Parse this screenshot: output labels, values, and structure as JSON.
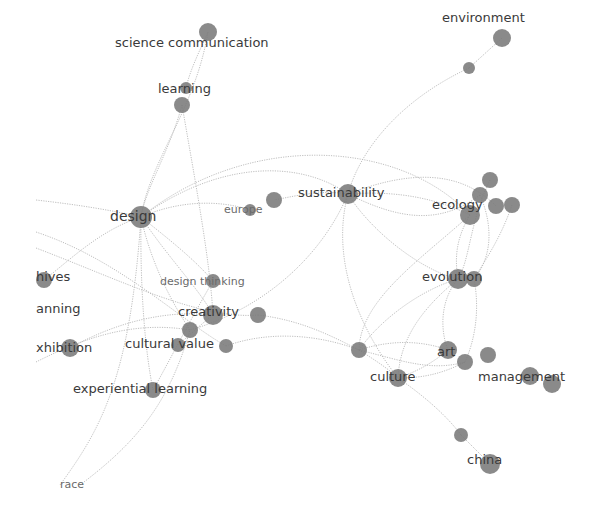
{
  "diagram": {
    "type": "keyword-co-occurrence-network",
    "node_color": "#7a7a7a",
    "edge_color": "#b8b8b8",
    "label_color": "#3a3a3a",
    "nodes": [
      {
        "id": "science_communication",
        "label": "science communication",
        "x": 208,
        "y": 32,
        "r": 9,
        "lx": 115,
        "ly": 47,
        "size": "normal"
      },
      {
        "id": "learning",
        "label": "learning",
        "x": 182,
        "y": 105,
        "r": 8,
        "lx": 158,
        "ly": 93,
        "size": "normal"
      },
      {
        "id": "learning_b",
        "label": "",
        "x": 186,
        "y": 88,
        "r": 6
      },
      {
        "id": "environment",
        "label": "environment",
        "x": 502,
        "y": 38,
        "r": 9,
        "lx": 442,
        "ly": 22,
        "size": "normal"
      },
      {
        "id": "environment_b",
        "label": "",
        "x": 469,
        "y": 68,
        "r": 6
      },
      {
        "id": "design",
        "label": "design",
        "x": 141,
        "y": 217,
        "r": 11,
        "lx": 110,
        "ly": 221,
        "size": "big"
      },
      {
        "id": "europe",
        "label": "europe",
        "x": 274,
        "y": 200,
        "r": 8,
        "lx": 224,
        "ly": 213,
        "size": "small"
      },
      {
        "id": "europe_b",
        "label": "",
        "x": 250,
        "y": 210,
        "r": 6
      },
      {
        "id": "sustainability",
        "label": "sustainability",
        "x": 348,
        "y": 194,
        "r": 10,
        "lx": 298,
        "ly": 197,
        "size": "normal"
      },
      {
        "id": "ecology",
        "label": "ecology",
        "x": 470,
        "y": 215,
        "r": 10,
        "lx": 432,
        "ly": 209,
        "size": "normal"
      },
      {
        "id": "ecology_b",
        "label": "",
        "x": 490,
        "y": 180,
        "r": 8
      },
      {
        "id": "ecology_c",
        "label": "",
        "x": 480,
        "y": 195,
        "r": 8
      },
      {
        "id": "ecology_d",
        "label": "",
        "x": 496,
        "y": 206,
        "r": 8
      },
      {
        "id": "ecology_e",
        "label": "",
        "x": 512,
        "y": 205,
        "r": 8
      },
      {
        "id": "evolution",
        "label": "evolution",
        "x": 458,
        "y": 279,
        "r": 10,
        "lx": 422,
        "ly": 281,
        "size": "normal"
      },
      {
        "id": "evolution_b",
        "label": "",
        "x": 474,
        "y": 279,
        "r": 8
      },
      {
        "id": "archives",
        "label": "hives",
        "x": 44,
        "y": 280,
        "r": 8,
        "lx": 36,
        "ly": 281,
        "size": "normal"
      },
      {
        "id": "planning",
        "label": "anning",
        "x": 0,
        "y": 0,
        "r": 0,
        "lx": 36,
        "ly": 313,
        "size": "normal"
      },
      {
        "id": "exhibition",
        "label": "xhibition",
        "x": 70,
        "y": 348,
        "r": 9,
        "lx": 36,
        "ly": 352,
        "size": "normal"
      },
      {
        "id": "design_thinking",
        "label": "design thinking",
        "x": 213,
        "y": 281,
        "r": 7,
        "lx": 160,
        "ly": 285,
        "size": "small"
      },
      {
        "id": "creativity",
        "label": "creativity",
        "x": 213,
        "y": 315,
        "r": 10,
        "lx": 178,
        "ly": 316,
        "size": "normal"
      },
      {
        "id": "creativity_b",
        "label": "",
        "x": 258,
        "y": 315,
        "r": 8
      },
      {
        "id": "cultural_value",
        "label": "cultural value",
        "x": 190,
        "y": 330,
        "r": 8,
        "lx": 125,
        "ly": 348,
        "size": "normal"
      },
      {
        "id": "cultural_value_b",
        "label": "",
        "x": 226,
        "y": 346,
        "r": 7
      },
      {
        "id": "cultural_value_c",
        "label": "",
        "x": 178,
        "y": 345,
        "r": 7
      },
      {
        "id": "experiential_learning",
        "label": "experiential learning",
        "x": 153,
        "y": 390,
        "r": 8,
        "lx": 73,
        "ly": 393,
        "size": "normal"
      },
      {
        "id": "race",
        "label": "race",
        "x": 0,
        "y": 0,
        "r": 0,
        "lx": 60,
        "ly": 488,
        "size": "small"
      },
      {
        "id": "hub_left_culture",
        "label": "",
        "x": 359,
        "y": 350,
        "r": 8
      },
      {
        "id": "art",
        "label": "art",
        "x": 448,
        "y": 350,
        "r": 9,
        "lx": 437,
        "ly": 356,
        "size": "normal"
      },
      {
        "id": "art_b",
        "label": "",
        "x": 465,
        "y": 362,
        "r": 8
      },
      {
        "id": "art_c",
        "label": "",
        "x": 488,
        "y": 355,
        "r": 8
      },
      {
        "id": "culture",
        "label": "culture",
        "x": 398,
        "y": 378,
        "r": 9,
        "lx": 370,
        "ly": 381,
        "size": "normal"
      },
      {
        "id": "management",
        "label": "management",
        "x": 530,
        "y": 376,
        "r": 9,
        "lx": 478,
        "ly": 381,
        "size": "normal"
      },
      {
        "id": "management_b",
        "label": "",
        "x": 552,
        "y": 384,
        "r": 9
      },
      {
        "id": "china",
        "label": "china",
        "x": 490,
        "y": 464,
        "r": 10,
        "lx": 467,
        "ly": 464,
        "size": "normal"
      },
      {
        "id": "china_b",
        "label": "",
        "x": 461,
        "y": 435,
        "r": 7
      }
    ],
    "edges": [
      [
        "science_communication",
        "design"
      ],
      [
        "learning",
        "design"
      ],
      [
        "learning_b",
        "science_communication"
      ],
      [
        "learning",
        "creativity"
      ],
      [
        "environment_b",
        "sustainability"
      ],
      [
        "environment_b",
        "environment"
      ],
      [
        "design",
        "sustainability"
      ],
      [
        "design",
        "europe_b"
      ],
      [
        "design",
        "ecology"
      ],
      [
        "design",
        "creativity"
      ],
      [
        "design",
        "design_thinking"
      ],
      [
        "design",
        "cultural_value"
      ],
      [
        "design",
        "experiential_learning"
      ],
      [
        "design",
        "archives"
      ],
      [
        "sustainability",
        "ecology"
      ],
      [
        "sustainability",
        "evolution"
      ],
      [
        "sustainability",
        "culture"
      ],
      [
        "sustainability",
        "cultural_value"
      ],
      [
        "sustainability",
        "europe"
      ],
      [
        "ecology",
        "evolution"
      ],
      [
        "ecology_b",
        "evolution"
      ],
      [
        "ecology_e",
        "evolution_b"
      ],
      [
        "evolution",
        "art"
      ],
      [
        "evolution",
        "culture"
      ],
      [
        "evolution",
        "hub_left_culture"
      ],
      [
        "art",
        "culture"
      ],
      [
        "art",
        "hub_left_culture"
      ],
      [
        "art_b",
        "culture"
      ],
      [
        "culture",
        "china_b"
      ],
      [
        "china_b",
        "china"
      ],
      [
        "creativity_b",
        "hub_left_culture"
      ],
      [
        "cultural_value_b",
        "hub_left_culture"
      ],
      [
        "exhibition",
        "creativity"
      ],
      [
        "design_thinking",
        "experiential_learning"
      ],
      [
        "creativity",
        "cultural_value_c"
      ]
    ]
  }
}
